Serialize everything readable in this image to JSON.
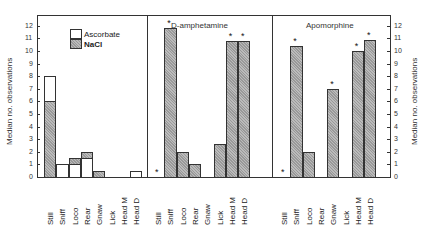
{
  "chart_data": {
    "type": "bar",
    "ylabel": "Median no. observations",
    "ylim": [
      0,
      12
    ],
    "yticks": [
      0,
      1,
      2,
      3,
      4,
      5,
      6,
      7,
      8,
      9,
      10,
      11,
      12
    ],
    "categories": [
      "Still",
      "Sniff",
      "Loco",
      "Rear",
      "Gnaw",
      "Lick",
      "Head M",
      "Head D"
    ],
    "legend": [
      "Ascorbate",
      "NaCl"
    ],
    "panels": [
      {
        "title": "",
        "series": [
          {
            "name": "Ascorbate",
            "values": [
              8,
              1,
              1,
              1.5,
              0,
              0,
              0,
              0.5
            ]
          },
          {
            "name": "NaCl",
            "values": [
              6,
              0,
              1.5,
              2,
              0.5,
              0,
              0,
              0
            ]
          }
        ],
        "significant": []
      },
      {
        "title": "D-amphetamine",
        "series": [
          {
            "name": "Drug",
            "values": [
              0,
              11.8,
              2,
              1,
              0,
              2.6,
              10.8,
              10.8
            ]
          }
        ],
        "significant": [
          "Still",
          "Sniff",
          "Head M",
          "Head D"
        ]
      },
      {
        "title": "Apomorphine",
        "series": [
          {
            "name": "Drug",
            "values": [
              0,
              10.4,
              2,
              0,
              7,
              0,
              10,
              10.9
            ]
          }
        ],
        "significant": [
          "Still",
          "Sniff",
          "Gnaw",
          "Head M",
          "Head D"
        ]
      }
    ]
  },
  "labels": {
    "ylabel": "Median no. observations",
    "legend_asc": "Ascorbate",
    "legend_nacl": "NaCl",
    "panel2_title": "D-amphetamine",
    "panel3_title": "Apomorphine",
    "star": "*"
  }
}
